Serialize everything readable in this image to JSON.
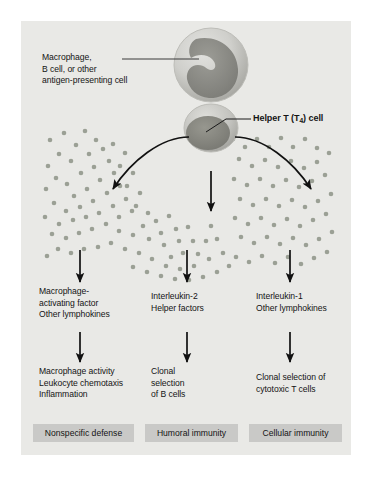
{
  "figure": {
    "background_color": "#e9e9e6",
    "callouts": [
      {
        "name": "macrophage-callout",
        "lines": [
          "Macrophage,",
          "B cell, or other",
          "antigen-presenting cell"
        ],
        "x": 21,
        "y": 33,
        "bold": false
      },
      {
        "name": "helper-t-callout",
        "text_before": "Helper T (T",
        "subscript": "4",
        "text_after": ") cell",
        "x": 212,
        "y": 99,
        "bold": true
      }
    ],
    "columns": [
      {
        "name": "nonspecific-defense-column",
        "mediators": [
          "Macrophage-",
          "activating factor",
          "Other lymphokines"
        ],
        "effects": [
          "Macrophage activity",
          "Leukocyte chemotaxis",
          "Inflammation"
        ],
        "outcome": "Nonspecific defense"
      },
      {
        "name": "humoral-immunity-column",
        "mediators": [
          "Interleukin-2",
          "Helper factors"
        ],
        "effects": [
          "Clonal",
          "selection",
          "of B cells"
        ],
        "outcome": "Humoral immunity"
      },
      {
        "name": "cellular-immunity-column",
        "mediators": [
          "Interleukin-1",
          "Other lymphokines"
        ],
        "effects": [
          "Clonal selection of",
          "cytotoxic T cells"
        ],
        "outcome": "Cellular immunity"
      }
    ],
    "cells": [
      {
        "name": "macrophage-cell",
        "label": "Macrophage / antigen-presenting cell"
      },
      {
        "name": "helper-t-cell",
        "label": "Helper T (T4) cell"
      }
    ],
    "particles": {
      "name": "lymphokine-particles",
      "color": "#9ba095",
      "count": 150
    },
    "arrow_color": "#111111",
    "outcome_box_color": "#c9c9c7"
  }
}
